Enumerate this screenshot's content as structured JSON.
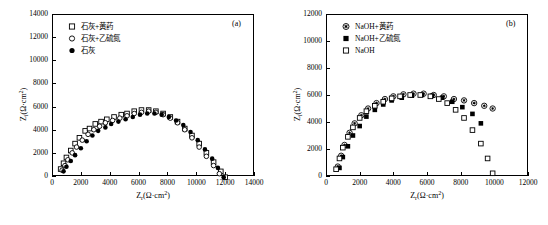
{
  "chart_data": [
    {
      "type": "scatter",
      "panel_label": "(a)",
      "xlabel": "Z_r(Ω·cm²)",
      "ylabel": "Z_i(Ω·cm²)",
      "xlim": [
        0,
        14000
      ],
      "ylim": [
        0,
        14000
      ],
      "xticks": [
        0,
        2000,
        4000,
        6000,
        8000,
        10000,
        12000,
        14000
      ],
      "yticks": [
        0,
        2000,
        4000,
        6000,
        8000,
        10000,
        12000,
        14000
      ],
      "grid": false,
      "legend_position": "top-left",
      "series": [
        {
          "name": "石灰+黄药",
          "marker": "open-square",
          "points": [
            [
              600,
              600
            ],
            [
              800,
              1100
            ],
            [
              1000,
              1600
            ],
            [
              1300,
              2200
            ],
            [
              1600,
              2800
            ],
            [
              1900,
              3300
            ],
            [
              2300,
              3900
            ],
            [
              2600,
              4100
            ],
            [
              3000,
              4500
            ],
            [
              3400,
              4700
            ],
            [
              3800,
              4900
            ],
            [
              4300,
              5100
            ],
            [
              4800,
              5300
            ],
            [
              5200,
              5400
            ],
            [
              5700,
              5600
            ],
            [
              6200,
              5700
            ],
            [
              6700,
              5700
            ],
            [
              7200,
              5600
            ],
            [
              7700,
              5400
            ],
            [
              8200,
              5100
            ],
            [
              8700,
              4700
            ],
            [
              9200,
              4100
            ],
            [
              9700,
              3500
            ],
            [
              10200,
              2800
            ],
            [
              10700,
              2000
            ],
            [
              11200,
              1200
            ],
            [
              11700,
              400
            ],
            [
              12000,
              -100
            ]
          ]
        },
        {
          "name": "石灰+乙硫氮",
          "marker": "open-circle",
          "points": [
            [
              700,
              500
            ],
            [
              900,
              900
            ],
            [
              1100,
              1400
            ],
            [
              1400,
              2000
            ],
            [
              1700,
              2500
            ],
            [
              2100,
              3100
            ],
            [
              2500,
              3600
            ],
            [
              2900,
              4000
            ],
            [
              3300,
              4300
            ],
            [
              3700,
              4600
            ],
            [
              4200,
              4800
            ],
            [
              4700,
              5000
            ],
            [
              5200,
              5200
            ],
            [
              5700,
              5400
            ],
            [
              6200,
              5500
            ],
            [
              6700,
              5600
            ],
            [
              7200,
              5500
            ],
            [
              7700,
              5300
            ],
            [
              8200,
              5000
            ],
            [
              8700,
              4600
            ],
            [
              9200,
              4000
            ],
            [
              9700,
              3300
            ],
            [
              10200,
              2500
            ],
            [
              10700,
              1700
            ],
            [
              11200,
              900
            ],
            [
              11600,
              200
            ]
          ]
        },
        {
          "name": "石灰",
          "marker": "filled-circle",
          "points": [
            [
              800,
              400
            ],
            [
              1000,
              800
            ],
            [
              1300,
              1300
            ],
            [
              1600,
              1800
            ],
            [
              2000,
              2400
            ],
            [
              2400,
              3000
            ],
            [
              2800,
              3500
            ],
            [
              3200,
              3900
            ],
            [
              3700,
              4200
            ],
            [
              4100,
              4500
            ],
            [
              4600,
              4700
            ],
            [
              5100,
              4900
            ],
            [
              5600,
              5100
            ],
            [
              6100,
              5300
            ],
            [
              6600,
              5400
            ],
            [
              7100,
              5400
            ],
            [
              7600,
              5300
            ],
            [
              8100,
              5100
            ],
            [
              8600,
              4800
            ],
            [
              9100,
              4400
            ],
            [
              9600,
              3800
            ],
            [
              10100,
              3100
            ],
            [
              10600,
              2300
            ],
            [
              11100,
              1500
            ],
            [
              11500,
              700
            ],
            [
              11900,
              -100
            ]
          ]
        }
      ]
    },
    {
      "type": "scatter",
      "panel_label": "(b)",
      "xlabel": "Z_r(Ω·cm²)",
      "ylabel": "Z_i(Ω·cm²)",
      "xlim": [
        0,
        12000
      ],
      "ylim": [
        0,
        12000
      ],
      "xticks": [
        0,
        2000,
        4000,
        6000,
        8000,
        10000,
        12000
      ],
      "yticks": [
        0,
        2000,
        4000,
        6000,
        8000,
        10000,
        12000
      ],
      "grid": false,
      "legend_position": "top-left",
      "series": [
        {
          "name": "NaOH+黄药",
          "marker": "circled-star",
          "points": [
            [
              700,
              700
            ],
            [
              900,
              1500
            ],
            [
              1100,
              2300
            ],
            [
              1400,
              3200
            ],
            [
              1700,
              3900
            ],
            [
              2100,
              4500
            ],
            [
              2500,
              5000
            ],
            [
              3000,
              5400
            ],
            [
              3500,
              5700
            ],
            [
              4000,
              5900
            ],
            [
              4600,
              6050
            ],
            [
              5200,
              6100
            ],
            [
              5800,
              6100
            ],
            [
              6400,
              6000
            ],
            [
              7000,
              5900
            ],
            [
              7600,
              5700
            ],
            [
              8200,
              5600
            ],
            [
              8800,
              5400
            ],
            [
              9400,
              5200
            ],
            [
              9900,
              5000
            ]
          ]
        },
        {
          "name": "NaOH+乙硫氮",
          "marker": "filled-square",
          "points": [
            [
              800,
              600
            ],
            [
              1000,
              1400
            ],
            [
              1300,
              2200
            ],
            [
              1600,
              3000
            ],
            [
              2000,
              3700
            ],
            [
              2400,
              4400
            ],
            [
              2900,
              4900
            ],
            [
              3400,
              5300
            ],
            [
              3900,
              5600
            ],
            [
              4500,
              5800
            ],
            [
              5100,
              5950
            ],
            [
              5700,
              6000
            ],
            [
              6300,
              5950
            ],
            [
              6900,
              5800
            ],
            [
              7500,
              5500
            ],
            [
              8100,
              5100
            ],
            [
              8700,
              4600
            ],
            [
              9200,
              3900
            ]
          ]
        },
        {
          "name": "NaOH",
          "marker": "open-square",
          "points": [
            [
              600,
              500
            ],
            [
              800,
              1300
            ],
            [
              1000,
              2100
            ],
            [
              1300,
              2900
            ],
            [
              1600,
              3600
            ],
            [
              2000,
              4300
            ],
            [
              2400,
              4800
            ],
            [
              2900,
              5200
            ],
            [
              3400,
              5500
            ],
            [
              3900,
              5750
            ],
            [
              4400,
              5900
            ],
            [
              5000,
              6000
            ],
            [
              5600,
              6000
            ],
            [
              6200,
              5900
            ],
            [
              6700,
              5700
            ],
            [
              7200,
              5400
            ],
            [
              7700,
              4900
            ],
            [
              8200,
              4300
            ],
            [
              8700,
              3400
            ],
            [
              9200,
              2400
            ],
            [
              9600,
              1300
            ],
            [
              9900,
              200
            ]
          ]
        }
      ]
    }
  ]
}
